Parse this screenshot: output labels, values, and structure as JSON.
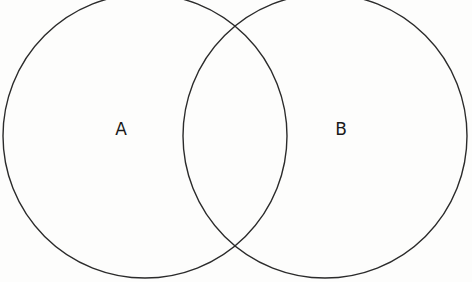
{
  "diagram": {
    "type": "venn",
    "width": 472,
    "height": 282,
    "background": "#fdfdfc",
    "stroke_color": "#2b2b2b",
    "sets": [
      {
        "id": "A",
        "label": "A",
        "cx": 145,
        "cy": 136,
        "r": 142,
        "label_x": 121,
        "label_y": 129
      },
      {
        "id": "B",
        "label": "B",
        "cx": 325,
        "cy": 136,
        "r": 142,
        "label_x": 341,
        "label_y": 129
      }
    ]
  }
}
